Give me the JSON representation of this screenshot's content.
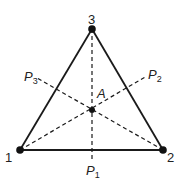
{
  "diagram": {
    "type": "triangle-with-medians",
    "vertices": [
      {
        "id": "1",
        "label": "1",
        "x": 20,
        "y": 150
      },
      {
        "id": "2",
        "label": "2",
        "x": 163,
        "y": 150
      },
      {
        "id": "3",
        "label": "3",
        "x": 92,
        "y": 29
      }
    ],
    "center": {
      "label": "A",
      "x": 92,
      "y": 110
    },
    "projection_labels": {
      "p1": {
        "base": "P",
        "sub": "1"
      },
      "p2": {
        "base": "P",
        "sub": "2"
      },
      "p3": {
        "base": "P",
        "sub": "3"
      }
    },
    "colors": {
      "line": "#1a1a1a",
      "text": "#222222"
    }
  }
}
